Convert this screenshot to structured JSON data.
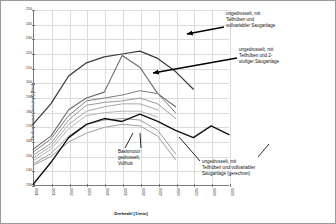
{
  "chart_data": {
    "type": "line",
    "title": "",
    "xlabel": "Drehzahl [1/min]",
    "ylabel": "Drehmoment (reduziert) [Nm]",
    "xlim": [
      1000,
      6500
    ],
    "ylim": [
      130,
      250
    ],
    "grid": true,
    "legend_position": "none",
    "x_ticks": [
      "1000",
      "1500",
      "2000",
      "2500",
      "3000",
      "3500",
      "4000",
      "4500",
      "5000",
      "5500",
      "6000",
      "6500"
    ],
    "y_ticks": [
      "250",
      "240",
      "230",
      "220",
      "210",
      "200",
      "190",
      "180",
      "170",
      "160",
      "150",
      "140",
      "130"
    ],
    "x": [
      1000,
      1500,
      2000,
      2500,
      3000,
      3500,
      4000,
      4500,
      5000,
      5500,
      6000,
      6500
    ],
    "series": [
      {
        "name": "ungedrosselt, mit Teilhuben und vollvariabler Sauganlage",
        "color": "#3a3a3a",
        "width": 1.25,
        "values": [
          172,
          186,
          205,
          214,
          218,
          220,
          222,
          217,
          208,
          196,
          null,
          null
        ]
      },
      {
        "name": "ungedrosselt, mit Teilhuben und 2-stufiger Sauganlage",
        "color": "#6b6b6b",
        "width": 1.1,
        "values": [
          155,
          164,
          182,
          190,
          194,
          219,
          211,
          193,
          184,
          null,
          null,
          null
        ]
      },
      {
        "name": "variant-3",
        "color": "#7d7d7d",
        "width": 1.0,
        "values": [
          153,
          162,
          178,
          188,
          190,
          192,
          195,
          193,
          180,
          null,
          null,
          null
        ]
      },
      {
        "name": "variant-4",
        "color": "#9a9a9a",
        "width": 1.0,
        "values": [
          151,
          159,
          175,
          185,
          187,
          188,
          190,
          186,
          176,
          null,
          null,
          null
        ]
      },
      {
        "name": "variant-5",
        "color": "#a8a8a8",
        "width": 1.0,
        "values": [
          149,
          157,
          172,
          181,
          184,
          186,
          186,
          182,
          null,
          null,
          null,
          null
        ]
      },
      {
        "name": "variant-6",
        "color": "#b5b5b5",
        "width": 1.0,
        "values": [
          147,
          155,
          169,
          178,
          180,
          181,
          181,
          177,
          null,
          null,
          null,
          null
        ]
      },
      {
        "name": "variant-7",
        "color": "#9e9e9e",
        "width": 1.0,
        "values": [
          145,
          152,
          164,
          172,
          175,
          176,
          175,
          168,
          152,
          null,
          null,
          null
        ]
      },
      {
        "name": "Basismotor gedrosselt, Vollhub",
        "color": "#9e9e9e",
        "width": 1.0,
        "values": [
          144,
          150,
          160,
          166,
          170,
          172,
          171,
          164,
          148,
          null,
          null,
          null
        ]
      },
      {
        "name": "ungedrosselt, mit Teilhuben und vollvariabler Sauganlage (gerechnet)",
        "color": "#111111",
        "width": 1.35,
        "values": [
          131,
          146,
          163,
          172,
          176,
          174,
          179,
          174,
          168,
          163,
          171,
          165
        ]
      }
    ],
    "annotations": [
      {
        "id": "vollvar",
        "text": "ungedrosselt, mit\nTeilhüben und\nvollvariabler Sauganlage",
        "points_to": [
          186,
          33
        ]
      },
      {
        "id": "2stufig",
        "text": "ungedrosselt, mit\nTeilhüben und 2-\nstufiger Sauganlage",
        "points_to": [
          152,
          72
        ]
      },
      {
        "id": "basis",
        "text": "Basismotor\ngedrosselt,\nVollhub",
        "points_to": [
          132,
          132
        ]
      },
      {
        "id": "gerechnet",
        "text": "ungedrosselt, mit\nTeilhüben und vollvariabler\nSauganlage (gerechnet)",
        "points_to": [
          178,
          136
        ]
      }
    ]
  }
}
